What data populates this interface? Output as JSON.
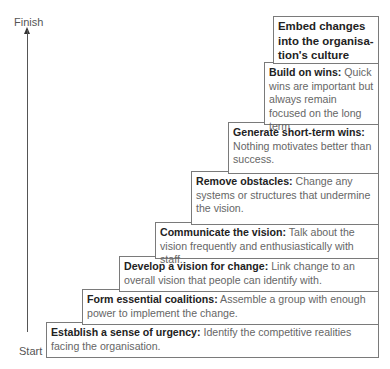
{
  "axis": {
    "finish_label": "Finish",
    "start_label": "Start"
  },
  "steps": [
    {
      "step": 1,
      "title": "Establish a sense of urgency:",
      "desc": "Identify the competitive realities facing the organisation."
    },
    {
      "step": 2,
      "title": "Form essential coalitions:",
      "desc": "Assemble a group with enough power to implement the change."
    },
    {
      "step": 3,
      "title": "Develop a vision for change:",
      "desc": "Link change to an overall vision that people can identify with."
    },
    {
      "step": 4,
      "title": "Communicate the vision:",
      "desc": "Talk about the vision frequently and enthusiastically with staff."
    },
    {
      "step": 5,
      "title": "Remove obstacles:",
      "desc": "Change any systems or structures that undermine the vision."
    },
    {
      "step": 6,
      "title": "Generate short-term wins:",
      "desc": "Nothing motivates better than success."
    },
    {
      "step": 7,
      "title": "Build on wins:",
      "desc": "Quick wins are important but always remain focused on the long term"
    },
    {
      "step": 8,
      "title": "Embed changes into the organisa-tion's culture",
      "desc": ""
    }
  ]
}
